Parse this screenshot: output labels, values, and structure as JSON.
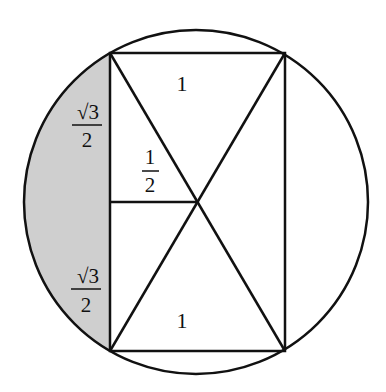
{
  "diagram": {
    "type": "geometry",
    "colors": {
      "stroke": "#111111",
      "shade": "#cfcfcf",
      "background": "#ffffff"
    },
    "circle": {
      "cx": 196,
      "cy": 202,
      "r": 172
    },
    "rectangle": {
      "x1": 110,
      "y1": 53,
      "x2": 285,
      "y2": 351
    },
    "center_point": {
      "x": 196,
      "y": 202
    },
    "labels": {
      "top_triangle": "1",
      "bottom_triangle": "1",
      "half_segment": {
        "numerator": "1",
        "denominator": "2"
      },
      "upper_left_side": {
        "numerator": "√3",
        "denominator": "2"
      },
      "lower_left_side": {
        "numerator": "√3",
        "denominator": "2"
      }
    }
  }
}
